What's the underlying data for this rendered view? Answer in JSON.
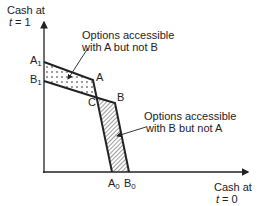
{
  "axes": {
    "y_label_line1": "Cash at",
    "y_label_line2_var": "t",
    "y_label_line2_rest": " = 1",
    "x_label_line1": "Cash at",
    "x_label_line2_var": "t",
    "x_label_line2_rest": " = 0"
  },
  "points": {
    "A1": {
      "main": "A",
      "sub": "1"
    },
    "B1": {
      "main": "B",
      "sub": "1"
    },
    "A": {
      "main": "A"
    },
    "B": {
      "main": "B"
    },
    "C": {
      "main": "C"
    },
    "A0": {
      "main": "A",
      "sub": "0"
    },
    "B0": {
      "main": "B",
      "sub": "0"
    }
  },
  "annotations": {
    "a_not_b_line1": "Options accessible",
    "a_not_b_line2": "with A but not B",
    "b_not_a_line1": "Options accessible",
    "b_not_a_line2": "with B but not A"
  },
  "regions": {
    "a_not_b_fill": "dotted",
    "b_not_a_fill": "hatched"
  },
  "colors": {
    "ink": "#222222",
    "background": "#ffffff"
  }
}
